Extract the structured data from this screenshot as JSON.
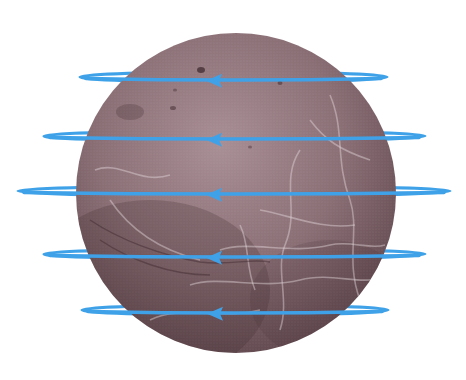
{
  "diagram": {
    "sphere": {
      "cx": 236,
      "cy": 193,
      "r": 160,
      "base_color": "#8a6f75",
      "light_color": "#b59ba1",
      "dark_color": "#5b4348",
      "vein_color": "#d9cdd2",
      "spot_color": "#3b262c"
    },
    "rings": [
      {
        "id": "ring-1",
        "cy": 77,
        "left": 80,
        "right": 387,
        "ry": 5,
        "arrow_x": 206,
        "direction": "left"
      },
      {
        "id": "ring-2",
        "cy": 136,
        "left": 44,
        "right": 425,
        "ry": 5,
        "arrow_x": 206,
        "direction": "left"
      },
      {
        "id": "ring-3",
        "cy": 191,
        "left": 18,
        "right": 450,
        "ry": 5,
        "arrow_x": 206,
        "direction": "left"
      },
      {
        "id": "ring-4",
        "cy": 254,
        "left": 44,
        "right": 425,
        "ry": 5,
        "arrow_x": 206,
        "direction": "left"
      },
      {
        "id": "ring-5",
        "cy": 310,
        "left": 82,
        "right": 388,
        "ry": 5,
        "arrow_x": 207,
        "direction": "left"
      }
    ],
    "ring_color": "#3fa2e8",
    "arrow_icon": "arrow-left-icon"
  }
}
